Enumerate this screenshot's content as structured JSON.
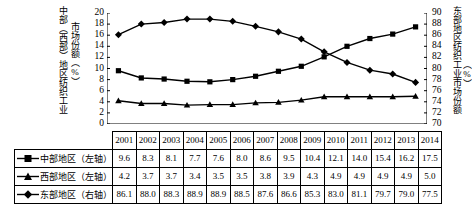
{
  "axis": {
    "left_label_line1": "中部（西部）地区纺织工业",
    "left_label_line2": "市场份额（%）",
    "right_label_line1": "东部地区纺织工业市场份额",
    "right_label_line2": "（%）",
    "left_ticks": [
      "20",
      "18",
      "16",
      "14",
      "12",
      "10",
      "8",
      "6",
      "4",
      "2",
      "0"
    ],
    "right_ticks": [
      "90",
      "88",
      "86",
      "84",
      "82",
      "80",
      "78",
      "76",
      "74",
      "72",
      "70"
    ]
  },
  "table": {
    "years": [
      "2001",
      "2002",
      "2003",
      "2004",
      "2005",
      "2006",
      "2007",
      "2008",
      "2009",
      "2010",
      "2011",
      "2012",
      "2013",
      "2014"
    ],
    "rows": [
      {
        "label": "中部地区（左轴）",
        "marker": "square",
        "values": [
          "9.6",
          "8.3",
          "8.1",
          "7.7",
          "7.6",
          "8.0",
          "8.6",
          "9.5",
          "10.4",
          "12.1",
          "14.0",
          "15.4",
          "16.2",
          "17.5"
        ]
      },
      {
        "label": "西部地区（左轴）",
        "marker": "triangle",
        "values": [
          "4.2",
          "3.7",
          "3.7",
          "3.4",
          "3.5",
          "3.5",
          "3.8",
          "3.9",
          "4.3",
          "4.9",
          "4.9",
          "4.9",
          "4.9",
          "5.0"
        ]
      },
      {
        "label": "东部地区（右轴）",
        "marker": "diamond",
        "values": [
          "86.1",
          "88.0",
          "88.3",
          "88.9",
          "88.9",
          "88.5",
          "87.6",
          "86.6",
          "85.3",
          "83.0",
          "81.1",
          "79.7",
          "79.0",
          "77.5"
        ]
      }
    ]
  },
  "chart_data": {
    "type": "line",
    "title": "",
    "xlabel": "",
    "ylabel": "中部（西部）地区纺织工业市场份额（%）",
    "y2label": "东部地区纺织工业市场份额（%）",
    "categories": [
      "2001",
      "2002",
      "2003",
      "2004",
      "2005",
      "2006",
      "2007",
      "2008",
      "2009",
      "2010",
      "2011",
      "2012",
      "2013",
      "2014"
    ],
    "ylim": [
      0,
      20
    ],
    "y2lim": [
      70,
      90
    ],
    "ytick_step": 2,
    "y2tick_step": 2,
    "grid": false,
    "legend": "table-row-labels",
    "series": [
      {
        "name": "中部地区（左轴）",
        "axis": "left",
        "marker": "square",
        "color": "#000000",
        "values": [
          9.6,
          8.3,
          8.1,
          7.7,
          7.6,
          8.0,
          8.6,
          9.5,
          10.4,
          12.1,
          14.0,
          15.4,
          16.2,
          17.5
        ]
      },
      {
        "name": "西部地区（左轴）",
        "axis": "left",
        "marker": "triangle",
        "color": "#000000",
        "values": [
          4.2,
          3.7,
          3.7,
          3.4,
          3.5,
          3.5,
          3.8,
          3.9,
          4.3,
          4.9,
          4.9,
          4.9,
          4.9,
          5.0
        ]
      },
      {
        "name": "东部地区（右轴）",
        "axis": "right",
        "marker": "diamond",
        "color": "#000000",
        "values": [
          86.1,
          88.0,
          88.3,
          88.9,
          88.9,
          88.5,
          87.6,
          86.6,
          85.3,
          83.0,
          81.1,
          79.7,
          79.0,
          77.5
        ]
      }
    ]
  }
}
